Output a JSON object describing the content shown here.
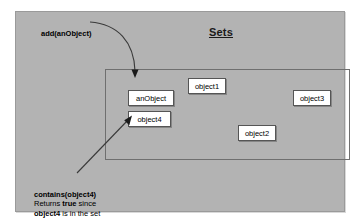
{
  "slide": {
    "title": "Sets",
    "background_color": "#b3b3b3",
    "page_background": "#ffffff"
  },
  "set_container": {
    "name": "set-rectangle",
    "border_color": "#6f6f6f"
  },
  "objects": [
    {
      "id": "anobject",
      "label": "anObject"
    },
    {
      "id": "object4",
      "label": "object4"
    },
    {
      "id": "object1",
      "label": "object1"
    },
    {
      "id": "object2",
      "label": "object2"
    },
    {
      "id": "object3",
      "label": "object3"
    }
  ],
  "annotations": {
    "add": {
      "label": "add(anObject)"
    },
    "contains": {
      "line1": "contains(object4)",
      "line2_prefix": " Returns ",
      "line2_bold": "true",
      "line2_suffix": " since",
      "line3_bold": "object4",
      "line3_suffix": " is in the set"
    }
  },
  "arrows": [
    {
      "name": "add-arrow",
      "from": "add(anObject)",
      "to": "anObject",
      "style": "curved"
    },
    {
      "name": "contains-arrow",
      "from": "contains(object4)",
      "to": "object4",
      "style": "straight"
    }
  ]
}
